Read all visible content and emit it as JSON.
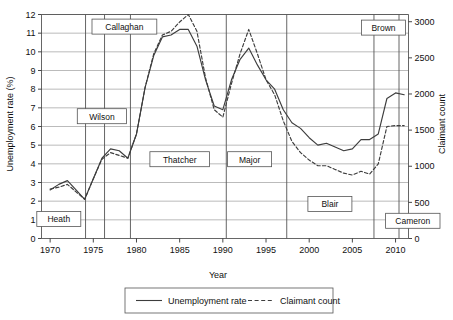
{
  "chart_data": {
    "type": "line",
    "title": "",
    "xlabel": "Year",
    "ylabel": "Unemployment rate (%)",
    "ylabel_right": "Claimant count",
    "xlim": [
      1969,
      2011.5
    ],
    "ylim": [
      0,
      12
    ],
    "ylim_right": [
      0,
      3100
    ],
    "grid": true,
    "legend_position": "bottom",
    "xticks": [
      1970,
      1975,
      1980,
      1985,
      1990,
      1995,
      2000,
      2005,
      2010
    ],
    "xtick_labels": [
      "1970",
      "1975",
      "1980",
      "1985",
      "1990",
      "1995",
      "2000",
      "2005",
      "2010"
    ],
    "yticks": [
      0,
      1,
      2,
      3,
      4,
      5,
      6,
      7,
      8,
      9,
      10,
      11,
      12
    ],
    "ytick_labels": [
      "0",
      "1",
      "2",
      "3",
      "4",
      "5",
      "6",
      "7",
      "8",
      "9",
      "10",
      "11",
      "12"
    ],
    "yticks_right": [
      0,
      500,
      1000,
      1500,
      2000,
      2500,
      3000
    ],
    "ytick_labels_right": [
      "0",
      "500",
      "1000",
      "1500",
      "2000",
      "2500",
      "3000"
    ],
    "series": [
      {
        "name": "Unemployment rate",
        "style": "solid",
        "color": "#3d3d3d",
        "axis": "left",
        "x": [
          1970,
          1971,
          1972,
          1973,
          1974,
          1975,
          1976,
          1977,
          1978,
          1979,
          1980,
          1981,
          1982,
          1983,
          1984,
          1985,
          1986,
          1987,
          1988,
          1989,
          1990,
          1991,
          1992,
          1993,
          1994,
          1995,
          1996,
          1997,
          1998,
          1999,
          2000,
          2001,
          2002,
          2003,
          2004,
          2005,
          2006,
          2007,
          2008,
          2009,
          2010,
          2011
        ],
        "values": [
          2.6,
          2.9,
          3.1,
          2.6,
          2.1,
          3.2,
          4.3,
          4.8,
          4.7,
          4.3,
          5.6,
          8.1,
          9.8,
          10.8,
          10.9,
          11.2,
          11.2,
          10.3,
          8.5,
          7.1,
          6.9,
          8.5,
          9.6,
          10.2,
          9.3,
          8.5,
          8.0,
          6.9,
          6.2,
          5.9,
          5.4,
          5.0,
          5.1,
          4.9,
          4.7,
          4.8,
          5.3,
          5.3,
          5.6,
          7.5,
          7.8,
          7.7
        ]
      },
      {
        "name": "Claimant count",
        "style": "dashed",
        "color": "#3d3d3d",
        "axis": "right",
        "x": [
          1970,
          1971,
          1972,
          1973,
          1974,
          1975,
          1976,
          1977,
          1978,
          1979,
          1980,
          1981,
          1982,
          1983,
          1984,
          1985,
          1986,
          1987,
          1988,
          1989,
          1990,
          1991,
          1992,
          1993,
          1994,
          1995,
          1996,
          1997,
          1998,
          1999,
          2000,
          2001,
          2002,
          2003,
          2004,
          2005,
          2006,
          2007,
          2008,
          2009,
          2010,
          2011
        ],
        "values_left_equiv": [
          2.65,
          2.75,
          2.9,
          2.5,
          2.1,
          3.2,
          4.25,
          4.6,
          4.45,
          4.3,
          5.6,
          8.1,
          9.9,
          10.9,
          11.1,
          11.6,
          12.0,
          11.1,
          8.6,
          6.9,
          6.5,
          8.3,
          9.9,
          11.2,
          9.9,
          8.5,
          7.7,
          6.3,
          5.2,
          4.6,
          4.2,
          3.9,
          3.9,
          3.7,
          3.5,
          3.4,
          3.6,
          3.45,
          4.0,
          6.0,
          6.05,
          6.05
        ],
        "values": [
          683,
          709,
          748,
          645,
          542,
          825,
          1096,
          1186,
          1148,
          1109,
          1444,
          2089,
          2553,
          2811,
          2863,
          2992,
          3095,
          2863,
          2218,
          1780,
          1677,
          2141,
          2553,
          2889,
          2553,
          2192,
          1986,
          1625,
          1341,
          1186,
          1083,
          1006,
          1006,
          954,
          903,
          877,
          929,
          890,
          1032,
          1548,
          1561,
          1561
        ]
      }
    ],
    "pm_terms": [
      {
        "name": "Heath",
        "start": 1969.0,
        "end": 1974.1
      },
      {
        "name": "Wilson",
        "start": 1974.1,
        "end": 1976.3
      },
      {
        "name": "Callaghan",
        "start": 1976.3,
        "end": 1979.3
      },
      {
        "name": "Thatcher",
        "start": 1979.3,
        "end": 1990.4
      },
      {
        "name": "Major",
        "start": 1990.4,
        "end": 1997.4
      },
      {
        "name": "Blair",
        "start": 1997.4,
        "end": 2007.5
      },
      {
        "name": "Brown",
        "start": 2007.5,
        "end": 2010.4
      },
      {
        "name": "Cameron",
        "start": 2010.4,
        "end": 2011.5
      }
    ],
    "pm_dividers": [
      1974.1,
      1976.3,
      1979.3,
      1990.4,
      1997.4,
      2007.5,
      2010.4
    ],
    "pm_boxes": [
      {
        "name": "Heath",
        "cx": 1971.0,
        "cy": 1.05
      },
      {
        "name": "Wilson",
        "cx": 1976.0,
        "cy": 6.55
      },
      {
        "name": "Callaghan",
        "cx": 1978.6,
        "cy": 11.35
      },
      {
        "name": "Thatcher",
        "cx": 1985.0,
        "cy": 4.25
      },
      {
        "name": "Major",
        "cx": 1993.1,
        "cy": 4.25
      },
      {
        "name": "Blair",
        "cx": 2002.4,
        "cy": 1.85
      },
      {
        "name": "Brown",
        "cx": 2008.6,
        "cy": 11.3
      },
      {
        "name": "Cameron",
        "cx": 2012.0,
        "cy": 0.95
      }
    ],
    "legend": [
      {
        "label": "Unemployment rate",
        "style": "solid"
      },
      {
        "label": "Claimant count",
        "style": "dashed"
      }
    ]
  }
}
